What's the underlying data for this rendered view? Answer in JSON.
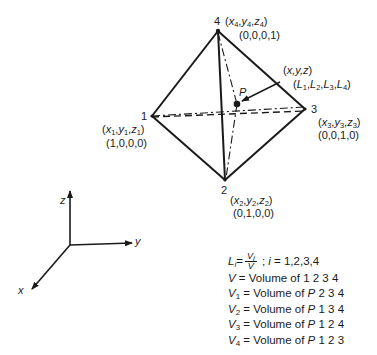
{
  "vertices": [
    {
      "id": "1",
      "label": "1",
      "coords": "(x1,y1,z1)",
      "natural": "(1,0,0,0)",
      "x_sym": "x",
      "y_sym": "y",
      "z_sym": "z",
      "sub": "1"
    },
    {
      "id": "2",
      "label": "2",
      "coords": "(x2,y2,z2)",
      "natural": "(0,1,0,0)",
      "x_sym": "x",
      "y_sym": "y",
      "z_sym": "z",
      "sub": "2"
    },
    {
      "id": "3",
      "label": "3",
      "coords": "(x3,y3,z3)",
      "natural": "(0,0,1,0)",
      "x_sym": "x",
      "y_sym": "y",
      "z_sym": "z",
      "sub": "3"
    },
    {
      "id": "4",
      "label": "4",
      "coords": "(x4,y4,z4)",
      "natural": "(0,0,0,1)",
      "x_sym": "x",
      "y_sym": "y",
      "z_sym": "z",
      "sub": "4"
    }
  ],
  "point": {
    "label": "P",
    "coords": "(x,y,z)",
    "natural": "(L1,L2,L3,L4)",
    "L": "L",
    "subs": [
      "1",
      "2",
      "3",
      "4"
    ]
  },
  "axes": {
    "x_label": "x",
    "y_label": "y",
    "z_label": "z"
  },
  "legend": {
    "formula": {
      "lhs": "L",
      "lhs_sub": "i",
      "equals": "=",
      "numerator": "V",
      "numerator_sub": "i",
      "denominator": "V",
      "separator": " ; ",
      "index": "i",
      "index_range": " = 1,2,3,4"
    },
    "rows": [
      {
        "sym": "V",
        "sub": "",
        "text": " = Volume of ",
        "pt": "",
        "verts": "1 2 3 4"
      },
      {
        "sym": "V",
        "sub": "1",
        "text": " = Volume of ",
        "pt": "P",
        "verts": " 2 3 4"
      },
      {
        "sym": "V",
        "sub": "2",
        "text": " = Volume of ",
        "pt": "P",
        "verts": " 1 3 4"
      },
      {
        "sym": "V",
        "sub": "3",
        "text": " = Volume of ",
        "pt": "P",
        "verts": " 1 2 4"
      },
      {
        "sym": "V",
        "sub": "4",
        "text": " = Volume of ",
        "pt": "P",
        "verts": " 1 2 3"
      }
    ]
  },
  "colors": {
    "ink": "#1a1a1a",
    "background": "#ffffff"
  }
}
